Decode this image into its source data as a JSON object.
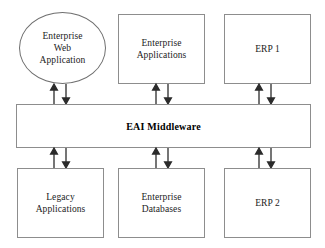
{
  "diagram": {
    "type": "block-diagram",
    "background_color": "#ffffff",
    "stroke_color": "#8d8d8d",
    "arrow_color": "#2b2b2b",
    "text_color": "#1b1b1b",
    "hub": {
      "label": "EAI Middleware",
      "shape": "rectangle",
      "bold": true,
      "x": 16,
      "y": 104,
      "width": 295,
      "height": 44
    },
    "top_nodes": [
      {
        "label": "Enterprise\nWeb\nApplication",
        "shape": "ellipse",
        "name": "enterprise-web-application",
        "x": 19,
        "y": 12,
        "width": 87,
        "height": 72
      },
      {
        "label": "Enterprise\nApplications",
        "shape": "rectangle",
        "name": "enterprise-applications",
        "x": 118,
        "y": 14,
        "width": 87,
        "height": 70
      },
      {
        "label": "ERP 1",
        "shape": "rectangle",
        "name": "erp-1",
        "x": 224,
        "y": 14,
        "width": 87,
        "height": 70
      }
    ],
    "bottom_nodes": [
      {
        "label": "Legacy\nApplications",
        "shape": "rectangle",
        "name": "legacy-applications",
        "x": 17,
        "y": 168,
        "width": 87,
        "height": 70
      },
      {
        "label": "Enterprise\nDatabases",
        "shape": "rectangle",
        "name": "enterprise-databases",
        "x": 118,
        "y": 168,
        "width": 87,
        "height": 70
      },
      {
        "label": "ERP 2",
        "shape": "rectangle",
        "name": "erp-2",
        "x": 224,
        "y": 168,
        "width": 87,
        "height": 70
      }
    ],
    "connectors": [
      {
        "name": "connector-web-application",
        "position": "top-left",
        "direction": "bidirectional",
        "up_arrow_x": 54,
        "down_arrow_x": 66,
        "y_top": 84,
        "y_bottom": 104
      },
      {
        "name": "connector-enterprise-applications",
        "position": "top-middle",
        "direction": "bidirectional",
        "up_arrow_x": 156,
        "down_arrow_x": 168,
        "y_top": 84,
        "y_bottom": 104
      },
      {
        "name": "connector-erp-1",
        "position": "top-right",
        "direction": "bidirectional",
        "up_arrow_x": 259,
        "down_arrow_x": 271,
        "y_top": 84,
        "y_bottom": 104
      },
      {
        "name": "connector-legacy-applications",
        "position": "bottom-left",
        "direction": "bidirectional",
        "up_arrow_x": 54,
        "down_arrow_x": 66,
        "y_top": 148,
        "y_bottom": 168
      },
      {
        "name": "connector-enterprise-databases",
        "position": "bottom-middle",
        "direction": "bidirectional",
        "up_arrow_x": 156,
        "down_arrow_x": 168,
        "y_top": 148,
        "y_bottom": 168
      },
      {
        "name": "connector-erp-2",
        "position": "bottom-right",
        "direction": "bidirectional",
        "up_arrow_x": 259,
        "down_arrow_x": 271,
        "y_top": 148,
        "y_bottom": 168
      }
    ]
  }
}
